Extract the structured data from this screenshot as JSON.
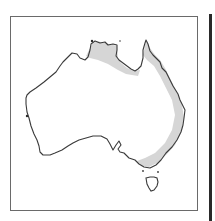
{
  "map": {
    "title": "",
    "region": "Australia",
    "legend": [],
    "range_shading": {
      "label": "distribution range",
      "color": "#d4d4d4",
      "areas": [
        "northern coast (Top End / Gulf of Carpentaria)",
        "eastern coast (Queensland to Victoria)"
      ]
    },
    "coastline_color": "#3a3a3a",
    "frame_color": "#6a6a6a"
  }
}
